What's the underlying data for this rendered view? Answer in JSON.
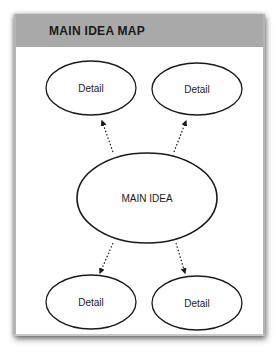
{
  "header": {
    "title": "MAIN IDEA MAP"
  },
  "nodes": {
    "main": {
      "label": "MAIN IDEA"
    },
    "details": [
      {
        "label": "Detail",
        "position": "top-left"
      },
      {
        "label": "Detail",
        "position": "top-right"
      },
      {
        "label": "Detail",
        "position": "bottom-left"
      },
      {
        "label": "Detail",
        "position": "bottom-right"
      }
    ]
  },
  "edges": [
    {
      "from": "main",
      "to": "top-left",
      "style": "dotted-arrow"
    },
    {
      "from": "main",
      "to": "top-right",
      "style": "dotted-arrow"
    },
    {
      "from": "main",
      "to": "bottom-left",
      "style": "dotted-arrow"
    },
    {
      "from": "main",
      "to": "bottom-right",
      "style": "dotted-arrow"
    }
  ],
  "colors": {
    "header_bg": "#a9a9a9",
    "stroke": "#1a1a1a",
    "card_bg": "#ffffff"
  }
}
